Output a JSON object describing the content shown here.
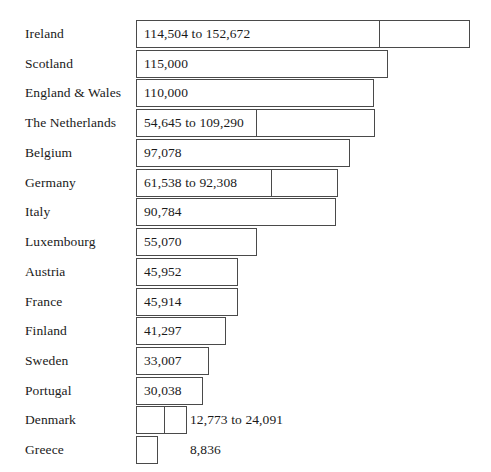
{
  "chart_data": {
    "type": "bar",
    "title": "",
    "subtitle": "",
    "xlabel": "",
    "ylabel": "",
    "orientation": "horizontal",
    "grid": false,
    "legend": null,
    "axis_visible": false,
    "xlim": [
      0,
      152672
    ],
    "categories": [
      "Ireland",
      "Scotland",
      "England & Wales",
      "The Netherlands",
      "Belgium",
      "Germany",
      "Italy",
      "Luxembourg",
      "Austria",
      "France",
      "Finland",
      "Sweden",
      "Portugal",
      "Denmark",
      "Greece"
    ],
    "values": [
      152672,
      115000,
      110000,
      109290,
      97078,
      92308,
      90784,
      55070,
      45952,
      45914,
      41297,
      33007,
      30038,
      24091,
      8836
    ],
    "range_low": [
      114504,
      null,
      null,
      54645,
      null,
      61538,
      null,
      null,
      null,
      null,
      null,
      null,
      null,
      12773,
      null
    ],
    "range_high": [
      152672,
      null,
      null,
      109290,
      null,
      92308,
      null,
      null,
      null,
      null,
      null,
      null,
      null,
      24091,
      null
    ],
    "data_labels": [
      "114,504 to 152,672",
      "115,000",
      "110,000",
      "54,645 to 109,290",
      "97,078",
      "61,538 to 92,308",
      "90,784",
      "55,070",
      "45,952",
      "45,914",
      "41,297",
      "33,007",
      "30,038",
      "12,773 to 24,091",
      "8,836"
    ],
    "label_placement": [
      "inside",
      "inside",
      "inside",
      "inside",
      "inside",
      "inside",
      "inside",
      "inside",
      "inside",
      "inside",
      "inside",
      "inside",
      "inside",
      "outside",
      "outside"
    ]
  },
  "style": {
    "bar_fill": "#ffffff",
    "bar_stroke": "#4a4a4a",
    "text_color": "#1a1a1a",
    "background": "#ffffff"
  },
  "geometry": {
    "bar_left_px": 136,
    "row_top_px": 20,
    "row_height_px": 29.73,
    "bar_height_px": 28,
    "outside_label_left_px": 190,
    "bar_right_px": [
      470,
      388,
      374,
      375,
      350,
      338,
      336,
      257,
      238,
      238,
      226,
      209,
      203,
      187,
      158
    ],
    "divider_px": [
      379,
      null,
      null,
      256,
      null,
      271,
      null,
      null,
      null,
      null,
      null,
      null,
      null,
      164,
      null
    ]
  }
}
